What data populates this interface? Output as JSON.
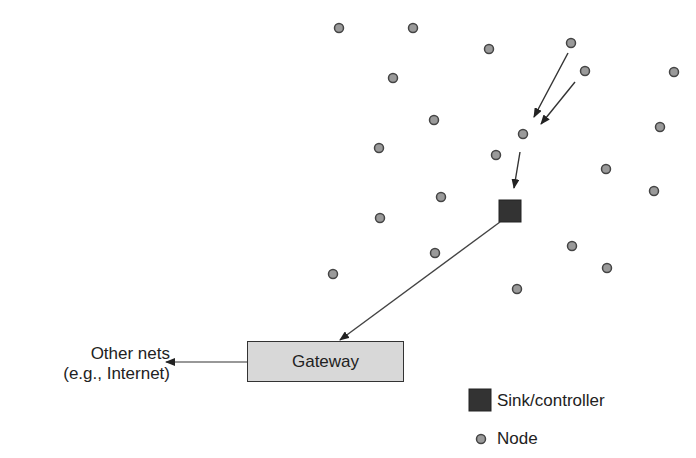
{
  "gateway": {
    "label": "Gateway"
  },
  "external": {
    "line1": "Other nets",
    "line2": "(e.g., Internet)"
  },
  "legend": {
    "sink_label": "Sink/controller",
    "node_label": "Node"
  },
  "colors": {
    "node_fill": "#9a9a9a",
    "node_stroke": "#444444",
    "sink_fill": "#333333",
    "gateway_fill": "#d8d8d8",
    "line": "#333333"
  },
  "nodes": [
    [
      339,
      28
    ],
    [
      413,
      28
    ],
    [
      489,
      49
    ],
    [
      571,
      43
    ],
    [
      585,
      71
    ],
    [
      674,
      72
    ],
    [
      393,
      78
    ],
    [
      434,
      120
    ],
    [
      523,
      134
    ],
    [
      660,
      127
    ],
    [
      379,
      148
    ],
    [
      496,
      155
    ],
    [
      606,
      169
    ],
    [
      654,
      191
    ],
    [
      441,
      197
    ],
    [
      380,
      218
    ],
    [
      572,
      246
    ],
    [
      435,
      253
    ],
    [
      333,
      274
    ],
    [
      607,
      268
    ],
    [
      517,
      289
    ]
  ],
  "sink": {
    "x": 499,
    "y": 200,
    "size": 22
  }
}
